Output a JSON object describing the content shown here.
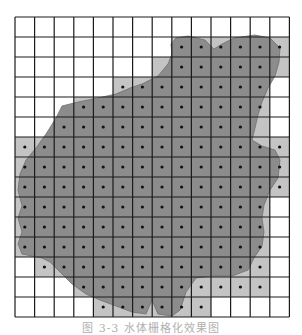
{
  "figure": {
    "caption": "图 3-3 水体栅格化效果图",
    "grid": {
      "origin_x": 15,
      "origin_y": 17,
      "cols": 14,
      "rows": 15,
      "cell_w": 19.6,
      "cell_h": 20
    },
    "colors": {
      "background": "#ffffff",
      "grid_line": "#1a1a1a",
      "shape_fill": "#8c8c8c",
      "cell_partial": "#c4c4c4",
      "dot": "#111111"
    },
    "legend": {
      "dark": "cell center inside water body",
      "light": "cell partially overlapping water body",
      "white": "cell outside water body"
    },
    "cells": [
      "..............",
      "........DDLDDL",
      ".......lDDDDDl",
      ".....LLDDDDDD.",
      "...LDDDDDDDDL.",
      "..LDDDDDDDDDl.",
      "LLDDDDDDDDDDLL",
      "LDDDDDDDDDDDDL",
      "DDDDDDDDDDDDDL",
      "LDDDDDDDDDDDD.",
      "DDDDDDDDDDDDD.",
      "LDDDDDDDDDDDL.",
      ".LDDDDDDDDDDL.",
      "...LDDDDDDLLL.",
      "....LDDDDL...."
    ],
    "shape_outline": "M171,44 L176,38 L188,36 L205,40 L214,49 L222,44 L234,38 L255,35 L270,38 L280,48 L279,62 L275,76 L268,88 L262,102 L258,115 L255,128 L252,140 L262,146 L275,150 L280,160 L278,178 L270,190 L264,205 L262,218 L264,232 L262,246 L254,258 L248,270 L232,276 L212,276 L196,278 L186,292 L180,310 L172,316 L158,314 L152,300 L146,314 L132,312 L116,306 L100,300 L86,294 L72,284 L60,272 L50,262 L42,258 L22,254 L18,244 L22,232 L18,218 L22,206 L18,190 L20,174 L26,160 L36,148 L46,134 L56,118 L62,106 L78,102 L98,98 L116,94 L130,88 L142,84 L158,76 L168,64 L172,54 Z"
  }
}
